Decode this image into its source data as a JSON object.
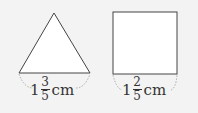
{
  "shapes": [
    {
      "type": "triangle",
      "label": {
        "whole": "1",
        "numerator": "3",
        "denominator": "5",
        "unit": "cm"
      }
    },
    {
      "type": "square",
      "label": {
        "whole": "1",
        "numerator": "2",
        "denominator": "5",
        "unit": "cm"
      }
    }
  ],
  "colors": {
    "background": "#f3f3f3",
    "stroke": "#444444",
    "fill": "#ffffff"
  }
}
